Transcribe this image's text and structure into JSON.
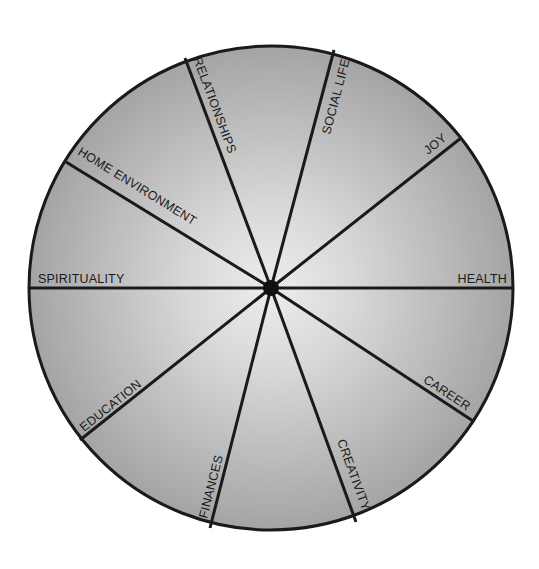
{
  "diagram": {
    "type": "wheel-of-life",
    "center": {
      "x": 271,
      "y": 288
    },
    "radius": 242,
    "hub_radius": 8,
    "colors": {
      "rim": "#1a1a1a",
      "spoke": "#1a1a1a",
      "hub": "#111111",
      "fill_center": "#f4f4f4",
      "fill_edge": "#a9a9a9",
      "background": "#ffffff"
    },
    "spokes": [
      {
        "id": "health",
        "label": "HEALTH",
        "end": {
          "x": 513,
          "y": 288
        }
      },
      {
        "id": "career",
        "label": "CAREER",
        "end": {
          "x": 473,
          "y": 421
        }
      },
      {
        "id": "creativity",
        "label": "CREATIVITY",
        "end": {
          "x": 356,
          "y": 522
        }
      },
      {
        "id": "finances",
        "label": "FINANCES",
        "end": {
          "x": 210,
          "y": 528
        }
      },
      {
        "id": "education",
        "label": "EDUCATION",
        "end": {
          "x": 80,
          "y": 440
        }
      },
      {
        "id": "spirituality",
        "label": "SPIRITUALITY",
        "end": {
          "x": 29,
          "y": 288
        }
      },
      {
        "id": "home-environment",
        "label": "HOME ENVIRONMENT",
        "end": {
          "x": 66,
          "y": 162
        }
      },
      {
        "id": "relationships",
        "label": "RELATIONSHIPS",
        "end": {
          "x": 185,
          "y": 58
        }
      },
      {
        "id": "social-life",
        "label": "SOCIAL LIFE",
        "end": {
          "x": 334,
          "y": 50
        }
      },
      {
        "id": "joy",
        "label": "JOY",
        "end": {
          "x": 461,
          "y": 138
        }
      }
    ]
  }
}
